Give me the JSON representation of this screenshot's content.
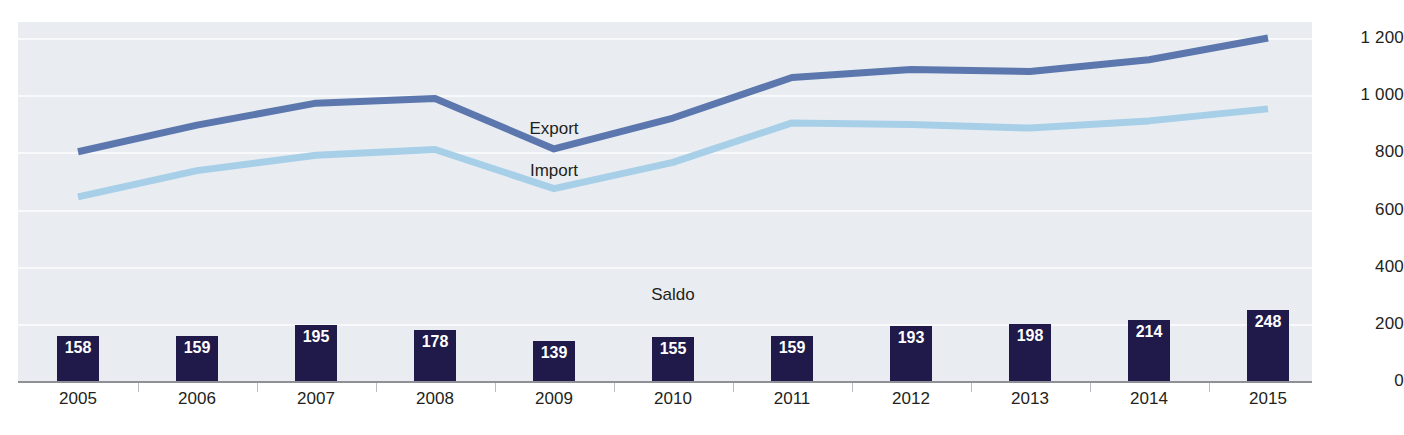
{
  "chart_data": {
    "type": "line",
    "title": "",
    "xlabel": "",
    "ylabel": "",
    "ylim": [
      0,
      1300
    ],
    "grid": true,
    "legend_position": "inline-labels",
    "categories": [
      "2005",
      "2006",
      "2007",
      "2008",
      "2009",
      "2010",
      "2011",
      "2012",
      "2013",
      "2014",
      "2015"
    ],
    "series": [
      {
        "name": "Export",
        "type": "line",
        "color": "#5b77ae",
        "values": [
          802,
          895,
          972,
          988,
          812,
          920,
          1062,
          1090,
          1083,
          1124,
          1200
        ]
      },
      {
        "name": "Import",
        "type": "line",
        "color": "#a8cfe8",
        "values": [
          644,
          736,
          790,
          810,
          673,
          765,
          903,
          897,
          885,
          910,
          952
        ]
      },
      {
        "name": "Saldo",
        "type": "bar",
        "color": "#201a4a",
        "values": [
          158,
          159,
          195,
          178,
          139,
          155,
          159,
          193,
          198,
          214,
          248
        ]
      }
    ],
    "ytick_labels": [
      "0",
      "200",
      "400",
      "600",
      "800",
      "1 000",
      "1 200"
    ],
    "ytick_values": [
      0,
      200,
      400,
      600,
      800,
      1000,
      1200
    ],
    "annotations": [
      {
        "text": "Export",
        "x_index": 4,
        "y": 880
      },
      {
        "text": "Import",
        "x_index": 4,
        "y": 735
      },
      {
        "text": "Saldo",
        "x_index": 5,
        "y": 300
      }
    ]
  },
  "labels": {
    "export": "Export",
    "import": "Import",
    "saldo": "Saldo"
  },
  "colors": {
    "export_line": "#5b77ae",
    "import_line": "#a8cfe8",
    "saldo_bar": "#201a4a",
    "plot_background": "#e9edf1",
    "gridline": "#f7f9fb",
    "axis": "#8d9196",
    "text": "#231f20"
  }
}
